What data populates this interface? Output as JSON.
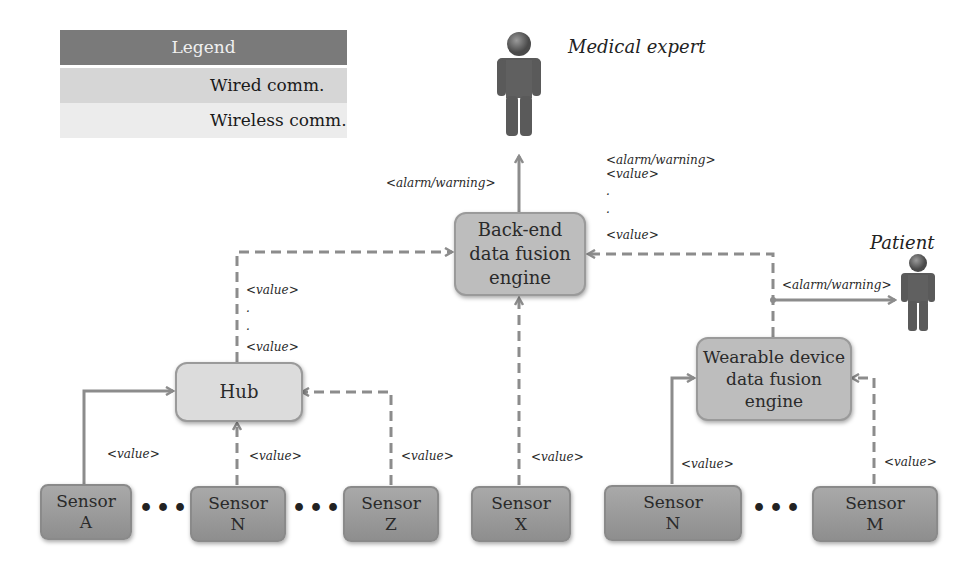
{
  "legend": {
    "title": "Legend",
    "wired_label": "Wired comm.",
    "wireless_label": "Wireless comm."
  },
  "actors": {
    "medical_expert": "Medical expert",
    "patient": "Patient"
  },
  "nodes": {
    "backend": "Back-end data fusion engine",
    "backend_lines": [
      "Back-end",
      "data fusion",
      "engine"
    ],
    "hub": "Hub",
    "wearable_lines": [
      "Wearable device",
      "data fusion",
      "engine"
    ],
    "sensors": [
      {
        "line1": "Sensor",
        "line2": "A"
      },
      {
        "line1": "Sensor",
        "line2": "N"
      },
      {
        "line1": "Sensor",
        "line2": "Z"
      },
      {
        "line1": "Sensor",
        "line2": "X"
      },
      {
        "line1": "Sensor",
        "line2": "N"
      },
      {
        "line1": "Sensor",
        "line2": "M"
      }
    ],
    "ellipsis": "•••"
  },
  "labels": {
    "backend_to_expert": "<alarm/warning>",
    "to_backend_right": [
      "<alarm/warning>",
      "<value>",
      ".",
      ".",
      "<value>"
    ],
    "hub_to_backend": [
      "<value>",
      ".",
      ".",
      "<value>"
    ],
    "wearable_to_patient": "<alarm/warning>",
    "value": "<value>"
  },
  "colors": {
    "line": "#8c8c8c",
    "legend_header": "#7a7a7a",
    "sensor_fill": "#9c9c9c",
    "engine_fill": "#bdbdbd",
    "hub_fill": "#dcdcdc"
  }
}
